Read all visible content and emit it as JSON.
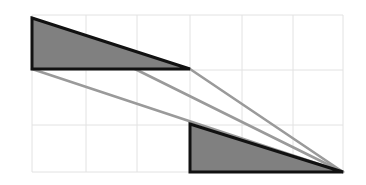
{
  "figure": {
    "width": 366,
    "height": 185,
    "background_color": "#ffffff",
    "grid": {
      "visible": true,
      "line_color": "#e2e2e2",
      "line_width": 1,
      "x_lines": [
        32,
        86,
        137,
        190,
        242,
        293,
        343
      ],
      "y_lines": [
        15,
        70,
        125,
        172
      ],
      "cell_width": 51,
      "cell_height": 54
    },
    "shapes": {
      "upper_triangle": {
        "name": "upper-filled-triangle",
        "points": "32,18 190,69 32,69",
        "fill_color": "#808080",
        "stroke_color": "#111111",
        "stroke_width": 3
      },
      "lower_triangle": {
        "name": "lower-filled-triangle",
        "points": "190,124 343,172 190,172",
        "fill_color": "#808080",
        "stroke_color": "#111111",
        "stroke_width": 3
      }
    },
    "guide_lines": {
      "color": "#9a9a9a",
      "width": 2.6,
      "segments": [
        {
          "name": "upper-hypotenuse-guide",
          "x1": 32,
          "y1": 18,
          "x2": 343,
          "y2": 172
        },
        {
          "name": "lower-hypotenuse-guide",
          "x1": 32,
          "y1": 69,
          "x2": 343,
          "y2": 172
        },
        {
          "name": "mid-connector-guide",
          "x1": 190,
          "y1": 69,
          "x2": 343,
          "y2": 172
        }
      ]
    }
  }
}
